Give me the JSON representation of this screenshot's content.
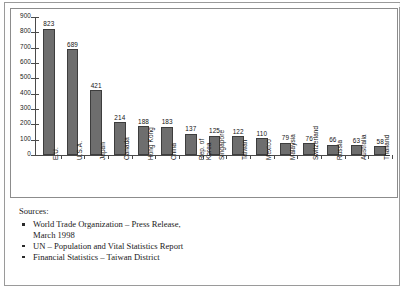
{
  "chart_data": {
    "type": "bar",
    "title": "",
    "xlabel": "",
    "ylabel": "",
    "ylim": [
      0,
      900
    ],
    "ytick_step": 100,
    "yticks": [
      "900",
      "800",
      "700",
      "600",
      "500",
      "400",
      "300",
      "200",
      "100",
      "0"
    ],
    "grid": false,
    "legend": "none",
    "bar_color": "#6e6e6e",
    "bar_border_color": "#3d3d3d",
    "categories": [
      "E.U.",
      "U.S.A.",
      "Japan",
      "Canada",
      "Hong Kong",
      "China",
      "Rep. of Korea",
      "Singapore",
      "Taiwan",
      "Mexico",
      "Malaysia",
      "Switzerland",
      "Russia",
      "Australia",
      "Thailand"
    ],
    "category_lines": [
      [
        "E.U."
      ],
      [
        "U.S.A."
      ],
      [
        "Japan"
      ],
      [
        "Canada"
      ],
      [
        "Hong Kong"
      ],
      [
        "China"
      ],
      [
        "Rep. of",
        "Korea"
      ],
      [
        "Singapore"
      ],
      [
        "Taiwan"
      ],
      [
        "Mexico"
      ],
      [
        "Malaysia"
      ],
      [
        "Switzerland"
      ],
      [
        "Russia"
      ],
      [
        "Australia"
      ],
      [
        "Thailand"
      ]
    ],
    "values": [
      823,
      689,
      421,
      214,
      188,
      183,
      137,
      125,
      122,
      110,
      79,
      76,
      66,
      63,
      58
    ],
    "value_labels": [
      "823",
      "689",
      "421",
      "214",
      "188",
      "183",
      "137",
      "125",
      "122",
      "110",
      "79",
      "76",
      "66",
      "63",
      "58"
    ]
  },
  "sources": {
    "title": "Sources:",
    "items": [
      {
        "line1": "World Trade Organization – Press Release,",
        "line2": "March 1998"
      },
      {
        "line1": "UN – Population and Vital Statistics Report",
        "line2": ""
      },
      {
        "line1": "Financial Statistics – Taiwan District",
        "line2": ""
      }
    ]
  }
}
